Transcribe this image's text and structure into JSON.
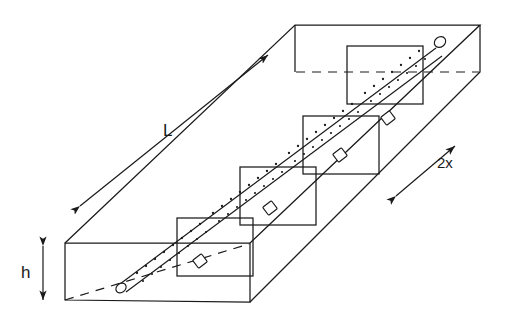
{
  "figure": {
    "type": "engineering-line-diagram",
    "background_color": "#ffffff",
    "line_color": "#1a1a1a",
    "canvas": {
      "width": 505,
      "height": 324
    }
  },
  "labels": {
    "length": "L",
    "height": "h",
    "width": "2x"
  },
  "dimension_annotations": [
    {
      "name": "length-dimension",
      "label": "L",
      "arrow_style": "double-headed",
      "orientation": "diagonal-up-right",
      "from": [
        80,
        206
      ],
      "to": [
        268,
        55
      ],
      "label_position": [
        163,
        122
      ]
    },
    {
      "name": "height-dimension",
      "label": "h",
      "arrow_style": "double-headed",
      "orientation": "vertical",
      "from": [
        43,
        245
      ],
      "to": [
        43,
        300
      ],
      "label_position": [
        21,
        264
      ]
    },
    {
      "name": "width-dimension",
      "label": "2x",
      "arrow_style": "double-headed",
      "orientation": "diagonal-up-right",
      "from": [
        396,
        196
      ],
      "to": [
        455,
        146
      ],
      "label_position": [
        437,
        155
      ]
    }
  ],
  "slab": {
    "name": "rectangular-slab",
    "projection": "oblique",
    "front_face": {
      "x1": 65,
      "y1": 243,
      "x2": 250,
      "y2": 302
    },
    "depth_vector": [
      230,
      -218
    ],
    "hidden_edges": [
      {
        "name": "hidden-bottom-back-edge",
        "from": [
          65,
          300
        ],
        "to": [
          250,
          243
        ]
      },
      {
        "name": "hidden-top-back-edge",
        "from": [
          295,
          72
        ],
        "to": [
          480,
          72
        ]
      }
    ]
  },
  "rod": {
    "name": "diagonal-rod",
    "from": [
      118,
      278
    ],
    "to": [
      440,
      38
    ],
    "end_cap": "rounded",
    "bead_count": 4,
    "bead_shape": "square",
    "texture": "stippled-dots"
  },
  "cross_sections": [
    {
      "name": "cross-section-1",
      "index": 1,
      "x": 177,
      "y": 218,
      "w": 76,
      "h": 58
    },
    {
      "name": "cross-section-2",
      "index": 2,
      "x": 240,
      "y": 167,
      "w": 76,
      "h": 58
    },
    {
      "name": "cross-section-3",
      "index": 3,
      "x": 303,
      "y": 116,
      "w": 76,
      "h": 58
    },
    {
      "name": "cross-section-4",
      "index": 4,
      "x": 347,
      "y": 46,
      "w": 76,
      "h": 58
    }
  ]
}
